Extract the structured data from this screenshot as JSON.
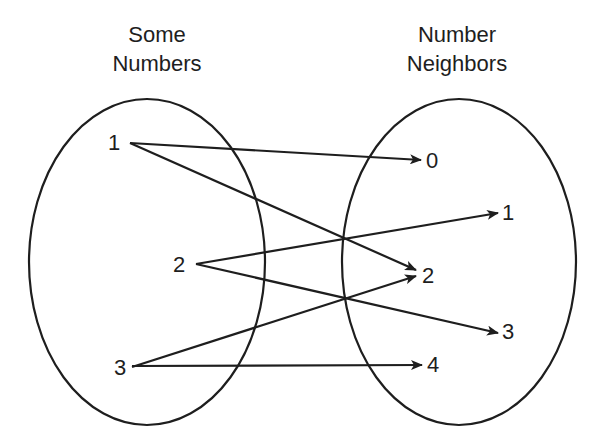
{
  "diagram": {
    "type": "mapping-diagram",
    "domain_set": {
      "title_line1": "Some",
      "title_line2": "Numbers",
      "elements": [
        "1",
        "2",
        "3"
      ]
    },
    "codomain_set": {
      "title_line1": "Number",
      "title_line2": "Neighbors",
      "elements": [
        "0",
        "1",
        "2",
        "3",
        "4"
      ]
    },
    "mappings": [
      {
        "from": "1",
        "to": "0"
      },
      {
        "from": "1",
        "to": "2"
      },
      {
        "from": "2",
        "to": "1"
      },
      {
        "from": "2",
        "to": "3"
      },
      {
        "from": "3",
        "to": "2"
      },
      {
        "from": "3",
        "to": "4"
      }
    ],
    "colors": {
      "stroke": "#1e1e1e",
      "background": "#ffffff"
    }
  }
}
